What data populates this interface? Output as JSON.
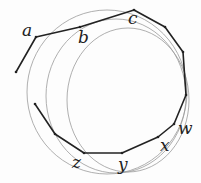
{
  "labels": {
    "a": "a",
    "b": "b",
    "c": "c",
    "w": "w",
    "x": "x",
    "y": "y",
    "z": "z"
  },
  "colors": {
    "polygon": "#222222",
    "circles": "#9a9a9a",
    "background": "#fdfdfd"
  },
  "polyline": "16,72 36,37 80,27 134,10 165,27 183,52 186,95 174,124 158,137 122,153 84,153 55,134 35,104",
  "circles": [
    {
      "cx": 107,
      "cy": 92,
      "rx": 80,
      "ry": 82
    },
    {
      "cx": 116,
      "cy": 96,
      "rx": 70,
      "ry": 77
    },
    {
      "cx": 128,
      "cy": 100,
      "rx": 61,
      "ry": 72
    }
  ]
}
